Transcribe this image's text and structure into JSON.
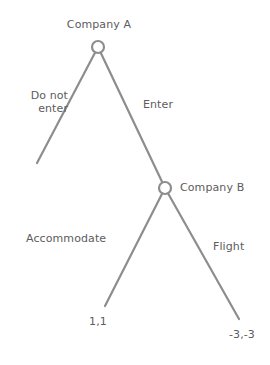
{
  "diagram": {
    "type": "game-tree",
    "background_color": "#ffffff",
    "line_color": "#8d8d8d",
    "text_color": "#5c5c5c",
    "nodes": [
      {
        "id": "company-a",
        "label": "Company A",
        "player": "Company A",
        "x": 98,
        "y": 47,
        "radius": 6,
        "label_position": "above"
      },
      {
        "id": "company-b",
        "label": "Company B",
        "player": "Company B",
        "x": 165,
        "y": 188,
        "radius": 6,
        "label_position": "right"
      }
    ],
    "edges": [
      {
        "id": "do-not-enter",
        "label": "Do not\nenter",
        "label_line_1": "Do not",
        "label_line_2": "enter",
        "from": "company-a",
        "to": "leaf-do-not-enter",
        "x1": 98,
        "y1": 47,
        "x2": 37,
        "y2": 163
      },
      {
        "id": "enter",
        "label": "Enter",
        "from": "company-a",
        "to": "company-b",
        "x1": 98,
        "y1": 47,
        "x2": 165,
        "y2": 188
      },
      {
        "id": "accommodate",
        "label": "Accommodate",
        "from": "company-b",
        "to": "leaf-accommodate",
        "x1": 165,
        "y1": 188,
        "x2": 105,
        "y2": 306
      },
      {
        "id": "flight",
        "label": "Flight",
        "from": "company-b",
        "to": "leaf-flight",
        "x1": 165,
        "y1": 188,
        "x2": 239,
        "y2": 319
      }
    ],
    "payoffs": [
      {
        "id": "payoff-accommodate",
        "label": "1,1",
        "values": [
          1,
          1
        ],
        "x": 98,
        "y": 322
      },
      {
        "id": "payoff-flight",
        "label": "-3,-3",
        "values": [
          -3,
          -3
        ],
        "x": 242,
        "y": 335
      }
    ]
  }
}
